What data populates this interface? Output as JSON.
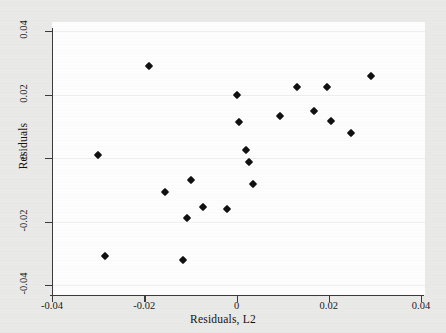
{
  "chart_data": {
    "type": "scatter",
    "title": "",
    "xlabel": "Residuals, L2",
    "ylabel": "Residuals",
    "xlim": [
      -0.04,
      0.04
    ],
    "ylim": [
      -0.04,
      0.04
    ],
    "xticks": [
      "-0.04",
      "-0.02",
      "0",
      "0.02",
      "0.04"
    ],
    "xtick_values": [
      -0.04,
      -0.02,
      0,
      0.02,
      0.04
    ],
    "yticks": [
      "0.04",
      "0.02",
      "0",
      "-0.02",
      "-0.04"
    ],
    "ytick_values": [
      0.04,
      0.02,
      0,
      -0.02,
      -0.04
    ],
    "grid": true,
    "legend": "none",
    "marker": "filled-diamond",
    "marker_color": "#101010",
    "background_color": "#e9e9e7",
    "plot_background_color": "#fdfdfd",
    "points": [
      {
        "x": -0.03,
        "y": 0.0008
      },
      {
        "x": -0.0285,
        "y": -0.0309
      },
      {
        "x": -0.019,
        "y": 0.029
      },
      {
        "x": -0.0155,
        "y": -0.0108
      },
      {
        "x": -0.0115,
        "y": -0.0322
      },
      {
        "x": -0.0108,
        "y": -0.0189
      },
      {
        "x": -0.0098,
        "y": -0.0069
      },
      {
        "x": -0.0073,
        "y": -0.0155
      },
      {
        "x": -0.002,
        "y": -0.0162
      },
      {
        "x": 0.0001,
        "y": 0.0199
      },
      {
        "x": 0.0005,
        "y": 0.0112
      },
      {
        "x": 0.002,
        "y": 0.0025
      },
      {
        "x": 0.0027,
        "y": -0.0012
      },
      {
        "x": 0.0035,
        "y": -0.0081
      },
      {
        "x": 0.0095,
        "y": 0.0132
      },
      {
        "x": 0.0132,
        "y": 0.0225
      },
      {
        "x": 0.0168,
        "y": 0.0147
      },
      {
        "x": 0.0196,
        "y": 0.0223
      },
      {
        "x": 0.0205,
        "y": 0.0115
      },
      {
        "x": 0.0248,
        "y": 0.0078
      },
      {
        "x": 0.0291,
        "y": 0.0259
      }
    ]
  }
}
